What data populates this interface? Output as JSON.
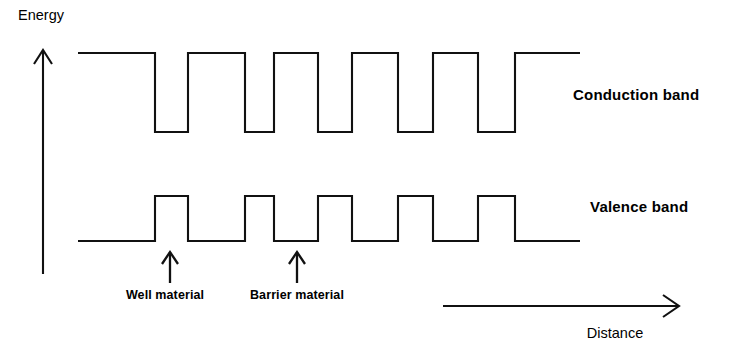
{
  "figure": {
    "kind": "band-structure-diagram",
    "background_color": "#ffffff",
    "line_color": "#111111"
  },
  "axes": {
    "y_axis": {
      "label": "Energy",
      "label_x": 18,
      "label_y": 20,
      "arrow_x": 43,
      "arrow_top_y": 50,
      "arrow_bottom_y": 274,
      "direction": "up"
    },
    "x_axis": {
      "label": "Distance",
      "label_x": 615,
      "label_y": 338,
      "arrow_y": 306,
      "arrow_left_x": 443,
      "arrow_right_x": 678,
      "direction": "right"
    }
  },
  "bands": [
    {
      "name": "conduction-band",
      "label": "Conduction band",
      "label_x": 573,
      "label_y": 100,
      "high_y": 53,
      "low_y": 132,
      "start_x": 78,
      "end_x": 580,
      "shape": "barrier-high-well-low",
      "segments": [
        {
          "type": "high",
          "x0": 78,
          "x1": 155
        },
        {
          "type": "low",
          "x0": 155,
          "x1": 188
        },
        {
          "type": "high",
          "x0": 188,
          "x1": 245
        },
        {
          "type": "low",
          "x0": 245,
          "x1": 274
        },
        {
          "type": "high",
          "x0": 274,
          "x1": 318
        },
        {
          "type": "low",
          "x0": 318,
          "x1": 352
        },
        {
          "type": "high",
          "x0": 352,
          "x1": 398
        },
        {
          "type": "low",
          "x0": 398,
          "x1": 433
        },
        {
          "type": "high",
          "x0": 433,
          "x1": 478
        },
        {
          "type": "low",
          "x0": 478,
          "x1": 515
        },
        {
          "type": "high",
          "x0": 515,
          "x1": 580
        }
      ]
    },
    {
      "name": "valence-band",
      "label": "Valence band",
      "label_x": 590,
      "label_y": 212,
      "high_y": 196,
      "low_y": 241,
      "start_x": 78,
      "end_x": 580,
      "shape": "barrier-high-well-low-inverted",
      "segments": [
        {
          "type": "low",
          "x0": 78,
          "x1": 155
        },
        {
          "type": "high",
          "x0": 155,
          "x1": 188
        },
        {
          "type": "low",
          "x0": 188,
          "x1": 245
        },
        {
          "type": "high",
          "x0": 245,
          "x1": 274
        },
        {
          "type": "low",
          "x0": 274,
          "x1": 318
        },
        {
          "type": "high",
          "x0": 318,
          "x1": 352
        },
        {
          "type": "low",
          "x0": 352,
          "x1": 398
        },
        {
          "type": "high",
          "x0": 398,
          "x1": 433
        },
        {
          "type": "low",
          "x0": 433,
          "x1": 478
        },
        {
          "type": "high",
          "x0": 478,
          "x1": 515
        },
        {
          "type": "low",
          "x0": 515,
          "x1": 580
        }
      ]
    }
  ],
  "annotations": [
    {
      "name": "well-material",
      "label": "Well material",
      "arrow_x": 170,
      "arrow_tip_y": 252,
      "arrow_tail_y": 283,
      "label_x": 165,
      "label_y": 299
    },
    {
      "name": "barrier-material",
      "label": "Barrier material",
      "arrow_x": 297,
      "arrow_tip_y": 252,
      "arrow_tail_y": 283,
      "label_x": 297,
      "label_y": 299
    }
  ],
  "chart_data": {
    "type": "line",
    "title": "",
    "xlabel": "Distance",
    "ylabel": "Energy",
    "grid": false,
    "legend": "none",
    "series": [
      {
        "name": "Conduction band",
        "x": [
          78,
          155,
          155,
          188,
          188,
          245,
          245,
          274,
          274,
          318,
          318,
          352,
          352,
          398,
          398,
          433,
          433,
          478,
          478,
          515,
          515,
          580
        ],
        "y": [
          "high",
          "high",
          "low",
          "low",
          "high",
          "high",
          "low",
          "low",
          "high",
          "high",
          "low",
          "low",
          "high",
          "high",
          "low",
          "low",
          "high",
          "high",
          "low",
          "low",
          "high",
          "high"
        ],
        "high_level": 53,
        "low_level": 132
      },
      {
        "name": "Valence band",
        "x": [
          78,
          155,
          155,
          188,
          188,
          245,
          245,
          274,
          274,
          318,
          318,
          352,
          352,
          398,
          398,
          433,
          433,
          478,
          478,
          515,
          515,
          580
        ],
        "y": [
          "low",
          "low",
          "high",
          "high",
          "low",
          "low",
          "high",
          "high",
          "low",
          "low",
          "high",
          "high",
          "low",
          "low",
          "high",
          "high",
          "low",
          "low",
          "high",
          "high",
          "low",
          "low"
        ],
        "high_level": 196,
        "low_level": 241
      }
    ],
    "annotations": [
      "Well material",
      "Barrier material"
    ],
    "period_count": 5
  }
}
